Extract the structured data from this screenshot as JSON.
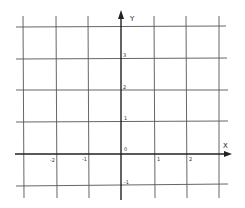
{
  "diagram": {
    "type": "coordinate-grid",
    "axes": {
      "x_label": "X",
      "y_label": "Y",
      "origin_label": "0"
    },
    "x_ticks": [
      {
        "value": -2,
        "label": "-2"
      },
      {
        "value": -1,
        "label": "-1"
      },
      {
        "value": 1,
        "label": "1"
      },
      {
        "value": 2,
        "label": "2"
      }
    ],
    "y_ticks": [
      {
        "value": 3,
        "label": "3"
      },
      {
        "value": 2,
        "label": "2"
      },
      {
        "value": 1,
        "label": "1"
      },
      {
        "value": -1,
        "label": "-1"
      }
    ],
    "x_range": [
      -3,
      3
    ],
    "y_range": [
      -1,
      4
    ],
    "grid": true,
    "colors": {
      "grid_line": "#555555",
      "axis_line": "#222222",
      "background": "#ffffff"
    }
  }
}
